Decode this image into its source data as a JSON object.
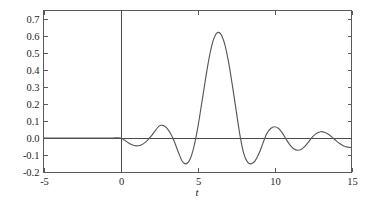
{
  "chart_data": {
    "type": "line",
    "title": "",
    "subtitle": "",
    "xlabel": "t",
    "ylabel": "",
    "xlim": [
      -5,
      15
    ],
    "ylim": [
      -0.2,
      0.75
    ],
    "grid": false,
    "legend": null,
    "x_ticks": [
      -5,
      0,
      5,
      10,
      15
    ],
    "x_tick_labels": [
      "-5",
      "0",
      "5",
      "10",
      "15"
    ],
    "y_ticks": [
      -0.2,
      -0.1,
      0.0,
      0.1,
      0.2,
      0.3,
      0.4,
      0.5,
      0.6,
      0.7
    ],
    "y_tick_labels": [
      "-0.2",
      "-0.1",
      "0.0",
      "0.1",
      "0.2",
      "0.3",
      "0.4",
      "0.5",
      "0.6",
      "0.7"
    ],
    "series": [
      {
        "name": "response",
        "color": "#58585a",
        "x": [
          -5.0,
          -4.5,
          -4.0,
          -3.5,
          -3.0,
          -2.5,
          -2.0,
          -1.5,
          -1.0,
          -0.5,
          0.0,
          0.25,
          0.5,
          0.75,
          1.0,
          1.25,
          1.5,
          1.75,
          2.0,
          2.25,
          2.5,
          2.75,
          3.0,
          3.25,
          3.5,
          3.75,
          4.0,
          4.25,
          4.5,
          4.75,
          5.0,
          5.25,
          5.5,
          5.75,
          6.0,
          6.25,
          6.5,
          6.75,
          7.0,
          7.25,
          7.5,
          7.75,
          8.0,
          8.25,
          8.5,
          8.75,
          9.0,
          9.25,
          9.5,
          9.75,
          10.0,
          10.25,
          10.5,
          10.75,
          11.0,
          11.25,
          11.5,
          11.75,
          12.0,
          12.25,
          12.5,
          12.75,
          13.0,
          13.25,
          13.5,
          13.75,
          14.0,
          14.25,
          14.5,
          14.75,
          15.0
        ],
        "y": [
          0.0,
          0.0,
          0.0,
          0.0,
          0.0,
          0.0,
          0.0,
          0.0,
          0.0,
          0.0,
          0.0,
          -0.012,
          -0.028,
          -0.04,
          -0.046,
          -0.044,
          -0.033,
          -0.014,
          0.012,
          0.042,
          0.07,
          0.074,
          0.06,
          0.026,
          -0.022,
          -0.082,
          -0.135,
          -0.152,
          -0.128,
          -0.058,
          0.052,
          0.19,
          0.335,
          0.468,
          0.568,
          0.617,
          0.613,
          0.558,
          0.455,
          0.318,
          0.168,
          0.02,
          -0.09,
          -0.142,
          -0.152,
          -0.133,
          -0.09,
          -0.03,
          0.026,
          0.056,
          0.066,
          0.057,
          0.03,
          -0.006,
          -0.04,
          -0.063,
          -0.072,
          -0.066,
          -0.046,
          -0.018,
          0.01,
          0.028,
          0.037,
          0.034,
          0.022,
          0.004,
          -0.016,
          -0.034,
          -0.047,
          -0.054,
          -0.056
        ]
      }
    ],
    "annotations": {
      "zero_line": 0.0,
      "vertical_axis_at": 0.0,
      "peak_value": 0.62,
      "peak_x": 6.3
    }
  },
  "figure": {
    "background": "#ffffff",
    "frame_color": "#5a5a5a",
    "curve_color": "#58585a",
    "text_color": "#262626"
  }
}
